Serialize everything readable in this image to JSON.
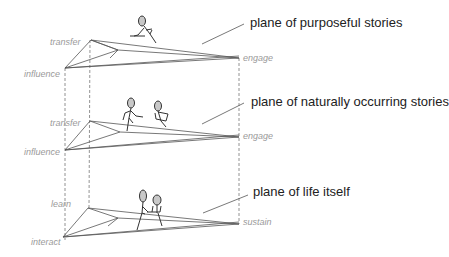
{
  "diagram": {
    "planes": [
      {
        "id": "purposeful",
        "label": "plane of purposeful stories",
        "corners": {
          "back_left": "transfer",
          "front_left": "influence",
          "right": "engage"
        },
        "figure": "single seated figure writing"
      },
      {
        "id": "natural",
        "label": "plane of naturally occurring stories",
        "corners": {
          "back_left": "transfer",
          "front_left": "influence",
          "right": "engage"
        },
        "figure": "two figures talking"
      },
      {
        "id": "life",
        "label": "plane of life itself",
        "corners": {
          "back_left": "learn",
          "front_left": "interact",
          "right": "sustain"
        },
        "figure": "two figures side by side"
      }
    ],
    "colors": {
      "line": "#555555",
      "dashed": "#777777",
      "corner_label": "#9a9a9a",
      "plane_label": "#222222",
      "head_fill": "#c8c8c8"
    }
  }
}
